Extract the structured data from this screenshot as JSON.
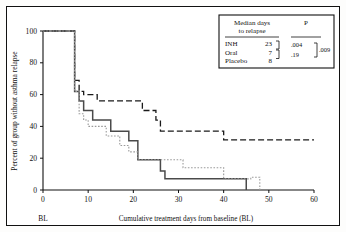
{
  "chart_data": {
    "type": "line",
    "title": "",
    "xlabel": "Cumulative treatment days from baseline (BL)",
    "ylabel": "Percent of group without asthma relapse",
    "xlim": [
      0,
      60
    ],
    "ylim": [
      0,
      100
    ],
    "xticks": [
      0,
      10,
      20,
      30,
      40,
      50,
      60
    ],
    "yticks": [
      0,
      20,
      40,
      60,
      80,
      100
    ],
    "xtick_labels": [
      "0",
      "10",
      "20",
      "30",
      "40",
      "50",
      "60"
    ],
    "ytick_labels": [
      "0",
      "20",
      "40",
      "60",
      "80",
      "100"
    ],
    "baseline_label": "BL",
    "grid": false,
    "legend_position": "top-right-inset-box",
    "style": "Kaplan-Meier step survival curves",
    "series": [
      {
        "name": "INH",
        "line_style": "dashed",
        "color": "#1a1a1a",
        "points": [
          [
            0,
            100
          ],
          [
            7,
            100
          ],
          [
            7,
            69
          ],
          [
            8,
            69
          ],
          [
            8,
            62
          ],
          [
            9,
            62
          ],
          [
            9,
            60
          ],
          [
            12,
            60
          ],
          [
            12,
            56
          ],
          [
            22,
            56
          ],
          [
            22,
            50
          ],
          [
            25,
            50
          ],
          [
            25,
            44
          ],
          [
            26,
            44
          ],
          [
            26,
            37
          ],
          [
            40,
            37
          ],
          [
            40,
            31.5
          ],
          [
            60,
            31.5
          ]
        ]
      },
      {
        "name": "Oral",
        "line_style": "solid",
        "color": "#4a4a4a",
        "points": [
          [
            0,
            100
          ],
          [
            7,
            100
          ],
          [
            7,
            62
          ],
          [
            8,
            62
          ],
          [
            8,
            56
          ],
          [
            9,
            56
          ],
          [
            9,
            50
          ],
          [
            11,
            50
          ],
          [
            11,
            44
          ],
          [
            15,
            44
          ],
          [
            15,
            37
          ],
          [
            19,
            37
          ],
          [
            19,
            31
          ],
          [
            21,
            31
          ],
          [
            21,
            19
          ],
          [
            26,
            19
          ],
          [
            26,
            12
          ],
          [
            27,
            12
          ],
          [
            27,
            7
          ],
          [
            45,
            7
          ],
          [
            45,
            0
          ]
        ]
      },
      {
        "name": "Placebo",
        "line_style": "dotted",
        "color": "#9a9a9a",
        "points": [
          [
            0,
            100
          ],
          [
            7,
            100
          ],
          [
            7,
            62
          ],
          [
            8,
            62
          ],
          [
            8,
            48
          ],
          [
            9,
            48
          ],
          [
            9,
            44
          ],
          [
            10,
            44
          ],
          [
            10,
            40
          ],
          [
            14,
            40
          ],
          [
            14,
            34
          ],
          [
            17,
            34
          ],
          [
            17,
            28
          ],
          [
            19,
            28
          ],
          [
            19,
            24
          ],
          [
            21,
            24
          ],
          [
            21,
            19
          ],
          [
            31,
            19
          ],
          [
            31,
            14
          ],
          [
            40,
            14
          ],
          [
            40,
            7
          ],
          [
            46,
            7
          ],
          [
            46,
            8
          ],
          [
            48,
            8
          ],
          [
            48,
            0
          ]
        ]
      }
    ],
    "legend_box": {
      "header_line1": "Median days",
      "header_line2": "to relapse",
      "p_header": "P",
      "rows": [
        {
          "group": "INH",
          "median_days": "23"
        },
        {
          "group": "Oral",
          "median_days": "7"
        },
        {
          "group": "Placebo",
          "median_days": "8"
        }
      ],
      "p_values": {
        "inh_vs_oral": ".004",
        "oral_vs_placebo": ".19",
        "overall": ".009"
      }
    }
  }
}
